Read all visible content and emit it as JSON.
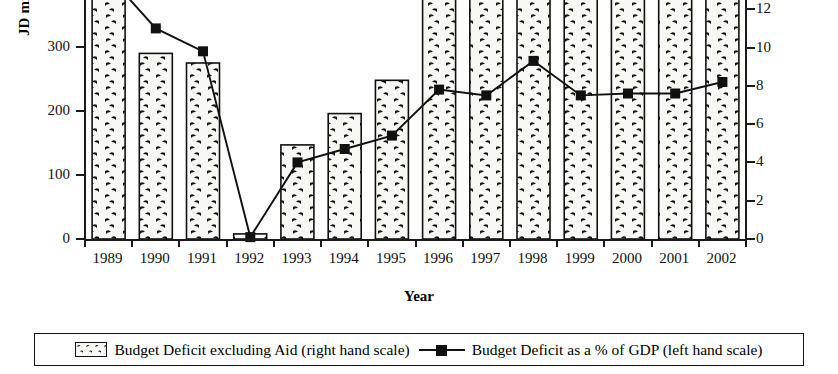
{
  "chart_data": {
    "type": "bar",
    "title": "",
    "xlabel": "Year",
    "ylabel_left": "JD millions",
    "ylabel_right": "Percentage",
    "categories": [
      "1989",
      "1990",
      "1991",
      "1992",
      "1993",
      "1994",
      "1995",
      "1996",
      "1997",
      "1998",
      "1999",
      "2000",
      "2001",
      "2002"
    ],
    "ylim_left": [
      0,
      380
    ],
    "ylim_right": [
      0,
      12.6
    ],
    "left_ticks": [
      0,
      100,
      200,
      300
    ],
    "right_ticks": [
      0,
      2,
      4,
      6,
      8,
      10,
      12
    ],
    "grid": false,
    "legend_position": "bottom",
    "note_axis_mismatch": "Legend states bars use the right hand scale and the line uses the left hand scale",
    "series": [
      {
        "name": "Budget Deficit excluding Aid (right hand scale)",
        "type": "bar",
        "unit": "JD millions",
        "axis": "left-scale-drawn",
        "values": [
          380,
          290,
          275,
          8,
          147,
          196,
          248,
          400,
          400,
          400,
          400,
          400,
          400,
          400
        ],
        "clipped_above_top": [
          true,
          false,
          false,
          false,
          false,
          false,
          false,
          true,
          true,
          true,
          true,
          true,
          true,
          true
        ]
      },
      {
        "name": "Budget Deficit as a % of GDP (left hand scale)",
        "type": "line",
        "unit": "Percentage",
        "axis": "right-scale-drawn",
        "marker": "square",
        "values": [
          null,
          11.0,
          9.8,
          0.1,
          4.0,
          4.7,
          5.4,
          7.8,
          7.5,
          9.3,
          7.5,
          7.6,
          7.6,
          8.2
        ]
      }
    ]
  },
  "axes": {
    "left": {
      "title": "JD millions",
      "ticks": [
        {
          "label": "300",
          "value": 300
        },
        {
          "label": "200",
          "value": 200
        },
        {
          "label": "100",
          "value": 100
        },
        {
          "label": "0",
          "value": 0
        }
      ]
    },
    "right": {
      "title": "Percentage",
      "ticks": [
        {
          "label": "12",
          "value": 12
        },
        {
          "label": "10",
          "value": 10
        },
        {
          "label": "8",
          "value": 8
        },
        {
          "label": "6",
          "value": 6
        },
        {
          "label": "4",
          "value": 4
        },
        {
          "label": "2",
          "value": 2
        },
        {
          "label": "0",
          "value": 0
        }
      ]
    },
    "x": {
      "title": "Year",
      "ticks": [
        "1989",
        "1990",
        "1991",
        "1992",
        "1993",
        "1994",
        "1995",
        "1996",
        "1997",
        "1998",
        "1999",
        "2000",
        "2001",
        "2002"
      ]
    }
  },
  "legend": {
    "entries": [
      {
        "label": "Budget Deficit excluding Aid (right hand scale)",
        "marker": "patterned-box"
      },
      {
        "label": "Budget Deficit as a % of GDP (left hand scale)",
        "marker": "line-square"
      }
    ]
  },
  "colors": {
    "ink": "#111111",
    "bar_fill": "#f7f7f4",
    "background": "#ffffff"
  }
}
